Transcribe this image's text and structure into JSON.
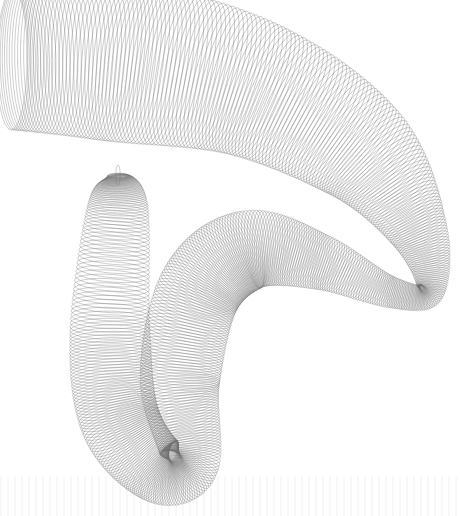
{
  "artwork": {
    "title": "Generative woven ribbon line art",
    "background": "#ffffff",
    "stroke_color": "#6e6e6e",
    "stroke_alpha": 0.55,
    "line_width": 0.6,
    "loops": 520,
    "centerline": [
      [
        12,
        60
      ],
      [
        120,
        62
      ],
      [
        250,
        88
      ],
      [
        360,
        150
      ],
      [
        418,
        230
      ],
      [
        430,
        292
      ],
      [
        390,
        292
      ],
      [
        320,
        262
      ],
      [
        250,
        250
      ],
      [
        200,
        290
      ],
      [
        180,
        380
      ],
      [
        190,
        460
      ],
      [
        160,
        470
      ],
      [
        120,
        420
      ],
      [
        110,
        330
      ],
      [
        118,
        205
      ],
      [
        118,
        175
      ]
    ],
    "ribbon_width": [
      70,
      80,
      70,
      55,
      30,
      14,
      16,
      28,
      40,
      42,
      40,
      30,
      34,
      40,
      40,
      30,
      10
    ]
  }
}
